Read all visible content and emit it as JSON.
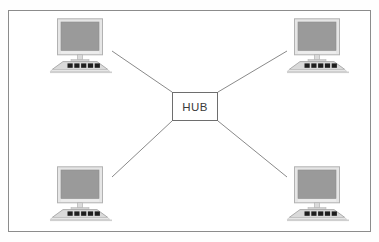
{
  "diagram": {
    "type": "network-topology",
    "topology": "star",
    "background_color": "#fefefe",
    "frame": {
      "x": 8,
      "y": 10,
      "width": 363,
      "height": 222,
      "stroke_color": "#8c8c8c",
      "fill_color": "#ffffff"
    },
    "hub": {
      "label": "HUB",
      "x": 172,
      "y": 92,
      "width": 46,
      "height": 29,
      "stroke_color": "#6e6e6e",
      "fill_color": "#ffffff",
      "text_color": "#3a3a3a"
    },
    "node_style": {
      "screen_color": "#9a9a9a",
      "bezel_color": "#e2e2e2",
      "bezel_stroke": "#b0b0b0",
      "keyboard_color": "#d8d8d8",
      "keyboard_stroke": "#a8a8a8",
      "key_color": "#1e1e1e",
      "key_count": 5,
      "desk_shadow_color": "#cfcfcf"
    },
    "nodes": [
      {
        "id": "pc-top-left",
        "name": "computer-top-left",
        "position": "top-left",
        "x": 48,
        "y": 18,
        "width": 66,
        "height": 56,
        "port": {
          "x": 111,
          "y": 50
        }
      },
      {
        "id": "pc-top-right",
        "name": "computer-top-right",
        "position": "top-right",
        "x": 285,
        "y": 18,
        "width": 66,
        "height": 56,
        "port": {
          "x": 288,
          "y": 50
        }
      },
      {
        "id": "pc-bottom-left",
        "name": "computer-bottom-left",
        "position": "bottom-left",
        "x": 48,
        "y": 166,
        "width": 66,
        "height": 56,
        "port": {
          "x": 111,
          "y": 176
        }
      },
      {
        "id": "pc-bottom-right",
        "name": "computer-bottom-right",
        "position": "bottom-right",
        "x": 285,
        "y": 166,
        "width": 66,
        "height": 56,
        "port": {
          "x": 288,
          "y": 176
        }
      }
    ],
    "links": [
      {
        "id": "link-hub-top-left",
        "name": "link-hub-to-top-left",
        "from": "hub",
        "to": "pc-top-left",
        "x1": 172,
        "y1": 92,
        "x2": 112,
        "y2": 51,
        "stroke_color": "#8a8a8a"
      },
      {
        "id": "link-hub-top-right",
        "name": "link-hub-to-top-right",
        "from": "hub",
        "to": "pc-top-right",
        "x1": 218,
        "y1": 92,
        "x2": 287,
        "y2": 51,
        "stroke_color": "#8a8a8a"
      },
      {
        "id": "link-hub-bottom-left",
        "name": "link-hub-to-bottom-left",
        "from": "hub",
        "to": "pc-bottom-left",
        "x1": 172,
        "y1": 121,
        "x2": 112,
        "y2": 177,
        "stroke_color": "#8a8a8a"
      },
      {
        "id": "link-hub-bottom-right",
        "name": "link-hub-to-bottom-right",
        "from": "hub",
        "to": "pc-bottom-right",
        "x1": 218,
        "y1": 121,
        "x2": 287,
        "y2": 177,
        "stroke_color": "#8a8a8a"
      }
    ]
  }
}
